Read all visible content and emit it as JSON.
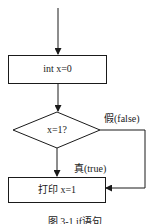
{
  "diagram": {
    "type": "flowchart",
    "nodes": [
      {
        "id": "assign",
        "shape": "process",
        "label": "int x=0"
      },
      {
        "id": "decision",
        "shape": "decision",
        "label": "x=1?"
      },
      {
        "id": "print",
        "shape": "process",
        "label": "打印 x=1"
      }
    ],
    "edges": [
      {
        "from": "entry",
        "to": "assign",
        "label": ""
      },
      {
        "from": "assign",
        "to": "decision",
        "label": ""
      },
      {
        "from": "decision",
        "to": "print",
        "label": "真(true)"
      },
      {
        "from": "decision",
        "to": "print",
        "label": "假(false)"
      }
    ],
    "labels": {
      "true_branch": "真(true)",
      "false_branch": "假(false)"
    },
    "caption": "图 3-1  if语句"
  },
  "colors": {
    "stroke": "#1a1a1a",
    "background": "#ffffff"
  }
}
